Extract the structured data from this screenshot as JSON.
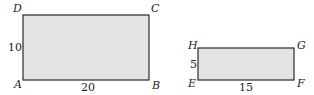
{
  "figure": {
    "rectangles": [
      {
        "id": "ABCD",
        "vertices": {
          "top_left": "D",
          "top_right": "C",
          "bottom_left": "A",
          "bottom_right": "B"
        },
        "height_label": "10",
        "width_label": "20",
        "fill": "#e3e3e3"
      },
      {
        "id": "EFGH",
        "vertices": {
          "top_left": "H",
          "top_right": "G",
          "bottom_left": "E",
          "bottom_right": "F"
        },
        "height_label": "5",
        "width_label": "15",
        "fill": "#e3e3e3"
      }
    ]
  }
}
